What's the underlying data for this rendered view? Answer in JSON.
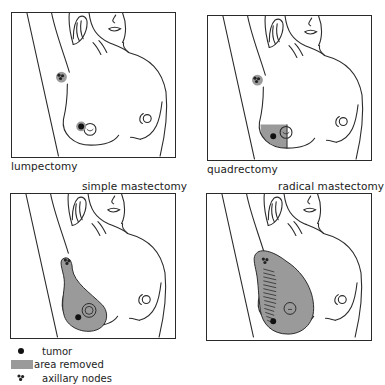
{
  "figure": {
    "panels": [
      {
        "id": "lumpectomy",
        "caption": "lumpectomy",
        "caption_position": "below-left"
      },
      {
        "id": "quadrectomy",
        "caption": "quadrectomy",
        "caption_position": "below-left"
      },
      {
        "id": "simple-mastectomy",
        "caption": "simple mastectomy",
        "caption_position": "above-right"
      },
      {
        "id": "radical-mastectomy",
        "caption": "radical mastectomy",
        "caption_position": "above-right"
      }
    ],
    "legend": [
      {
        "symbol": "black-dot",
        "label": "tumor"
      },
      {
        "symbol": "gray-swatch",
        "label": "area removed"
      },
      {
        "symbol": "node-cluster",
        "label": "axillary nodes"
      }
    ],
    "colors": {
      "outline": "#2a2a2a",
      "area_removed": "#9a9a9a",
      "tumor": "#111111"
    }
  }
}
